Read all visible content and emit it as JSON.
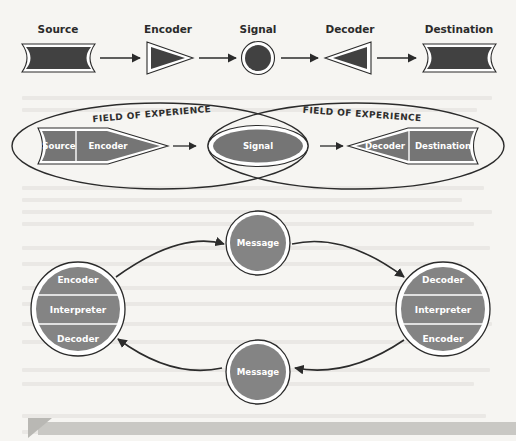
{
  "figure": {
    "background_color": "#f6f5f2",
    "ink_color": "#2b2b2b",
    "fill_dark": "#414141",
    "fill_mid": "#757575",
    "fill_light": "#848484",
    "text_on_fill": "#ffffff"
  },
  "model_linear": {
    "name": "Linear transmission model",
    "nodes": [
      {
        "id": "source",
        "label": "Source",
        "shape": "flag-rectangle"
      },
      {
        "id": "encoder",
        "label": "Encoder",
        "shape": "triangle-right"
      },
      {
        "id": "signal",
        "label": "Signal",
        "shape": "ringed-circle"
      },
      {
        "id": "decoder",
        "label": "Decoder",
        "shape": "triangle-left"
      },
      {
        "id": "destination",
        "label": "Destination",
        "shape": "flag-rectangle"
      }
    ],
    "connector": "arrow-right",
    "connector_count": 4
  },
  "model_fields": {
    "name": "Field of experience model",
    "left_field_label": "FIELD OF EXPERIENCE",
    "right_field_label": "FIELD OF EXPERIENCE",
    "left_group": [
      {
        "id": "source",
        "label": "Source"
      },
      {
        "id": "encoder",
        "label": "Encoder"
      }
    ],
    "center": {
      "id": "signal",
      "label": "Signal"
    },
    "right_group": [
      {
        "id": "decoder",
        "label": "Decoder"
      },
      {
        "id": "destination",
        "label": "Destination"
      }
    ],
    "connector": "arrow-right",
    "connector_count": 2
  },
  "model_circular": {
    "name": "Circular interactive model",
    "left_node": {
      "id": "communicator-left",
      "segments": [
        {
          "label": "Encoder"
        },
        {
          "label": "Interpreter"
        },
        {
          "label": "Decoder"
        }
      ]
    },
    "right_node": {
      "id": "communicator-right",
      "segments": [
        {
          "label": "Decoder"
        },
        {
          "label": "Interpreter"
        },
        {
          "label": "Encoder"
        }
      ]
    },
    "top_message": {
      "id": "message-top",
      "label": "Message"
    },
    "bottom_message": {
      "id": "message-bottom",
      "label": "Message"
    },
    "flow": "clockwise",
    "curved_arrow_count": 4
  },
  "footer_bar": {
    "id": "page-footer-bar",
    "color": "#c9c8c4",
    "corner_marker": "triangle"
  }
}
